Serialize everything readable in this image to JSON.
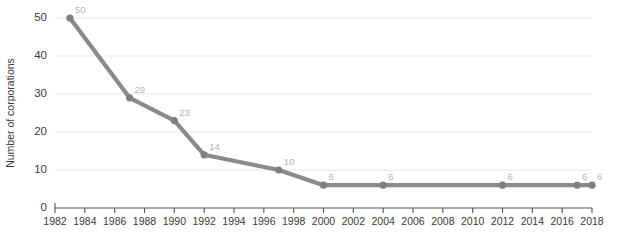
{
  "chart_data": {
    "type": "line",
    "title": "",
    "xlabel": "",
    "ylabel": "Number of corporations",
    "xlim": [
      1982,
      2018
    ],
    "ylim": [
      0,
      50
    ],
    "grid": true,
    "legend": "none",
    "y_ticks": [
      0,
      10,
      20,
      30,
      40,
      50
    ],
    "x_ticks": [
      1982,
      1984,
      1986,
      1988,
      1990,
      1992,
      1994,
      1996,
      1998,
      2000,
      2002,
      2004,
      2006,
      2008,
      2010,
      2012,
      2014,
      2016,
      2018
    ],
    "series": [
      {
        "name": "Number of corporations",
        "color": "#8a8a8a",
        "points": [
          {
            "x": 1983,
            "y": 50,
            "label": "50"
          },
          {
            "x": 1987,
            "y": 29,
            "label": "29"
          },
          {
            "x": 1990,
            "y": 23,
            "label": "23"
          },
          {
            "x": 1992,
            "y": 14,
            "label": "14"
          },
          {
            "x": 1997,
            "y": 10,
            "label": "10"
          },
          {
            "x": 2000,
            "y": 6,
            "label": "6"
          },
          {
            "x": 2004,
            "y": 6,
            "label": "6"
          },
          {
            "x": 2012,
            "y": 6,
            "label": "6"
          },
          {
            "x": 2017,
            "y": 6,
            "label": "6"
          },
          {
            "x": 2018,
            "y": 6,
            "label": "6"
          }
        ]
      }
    ],
    "colors": {
      "line": "#8a8a8a",
      "marker": "#7f7f7f",
      "grid": "#e8e8e8",
      "axis": "#555555",
      "tick_text": "#3a3a3a",
      "point_label": "#b4b4b4",
      "background": "#ffffff"
    }
  }
}
